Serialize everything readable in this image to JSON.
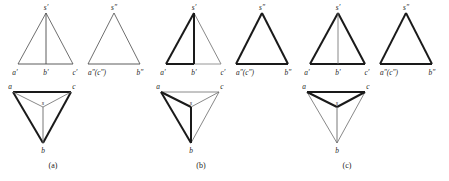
{
  "figure": {
    "groups": [
      {
        "id": "a",
        "caption": "(a)",
        "front_view": {
          "name": "front-view",
          "labels": {
            "apex": "s′",
            "left": "a′",
            "middle": "b′",
            "right": "c′"
          }
        },
        "side_view": {
          "name": "side-view",
          "labels": {
            "apex": "s″",
            "left": "a″(c″)",
            "right": "b″"
          }
        },
        "top_view": {
          "name": "top-view",
          "labels": {
            "left": "a",
            "right": "c",
            "bottom": "b",
            "center": "s"
          }
        }
      },
      {
        "id": "b",
        "caption": "(b)",
        "front_view": {
          "name": "front-view",
          "labels": {
            "apex": "s′",
            "left": "a′",
            "middle": "b′",
            "right": "c′"
          }
        },
        "side_view": {
          "name": "side-view",
          "labels": {
            "apex": "s″",
            "left": "a″(c″)",
            "right": "b″"
          }
        },
        "top_view": {
          "name": "top-view",
          "labels": {
            "left": "a",
            "right": "c",
            "bottom": "b",
            "center": "s"
          }
        }
      },
      {
        "id": "c",
        "caption": "(c)",
        "front_view": {
          "name": "front-view",
          "labels": {
            "apex": "s′",
            "left": "a′",
            "middle": "b′",
            "right": "c′"
          }
        },
        "side_view": {
          "name": "side-view",
          "labels": {
            "apex": "s″",
            "left": "a″(c″)",
            "right": "b″"
          }
        },
        "top_view": {
          "name": "top-view",
          "labels": {
            "left": "a",
            "right": "c",
            "bottom": "b",
            "center": "s"
          }
        }
      }
    ],
    "colors": {
      "line_normal": "#4a4a4a",
      "line_bold": "#1a1a1a",
      "background": "#ffffff",
      "text": "#1c1c1c"
    },
    "stroke_widths": {
      "thin": 0.8,
      "bold": 2.0
    }
  }
}
